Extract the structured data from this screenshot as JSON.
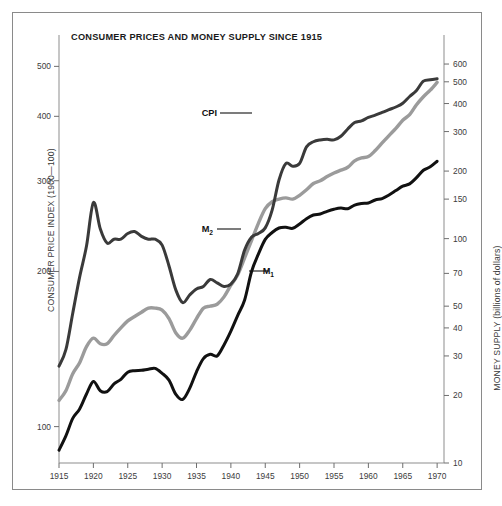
{
  "figure": {
    "title": "CONSUMER PRICES AND MONEY SUPPLY SINCE 1915",
    "border_color": "#8a8a8a",
    "background": "#ffffff"
  },
  "axes": {
    "left": {
      "title": "CONSUMER PRICE INDEX (1900—100)",
      "scale": "log",
      "ticks": [
        100,
        200,
        300,
        400,
        500
      ],
      "tick_labels": [
        "100",
        "200",
        "300",
        "400",
        "500"
      ],
      "range": [
        85,
        560
      ]
    },
    "right": {
      "title": "MONEY SUPPLY (billions of dollars)",
      "scale": "log",
      "ticks": [
        10,
        20,
        30,
        40,
        50,
        70,
        100,
        150,
        200,
        300,
        400,
        500,
        600
      ],
      "tick_labels": [
        "10",
        "20",
        "30",
        "40",
        "50",
        "70",
        "100",
        "150",
        "200",
        "300",
        "400",
        "500",
        "600"
      ],
      "range": [
        10,
        760
      ]
    },
    "bottom": {
      "ticks": [
        1915,
        1920,
        1925,
        1930,
        1935,
        1940,
        1945,
        1950,
        1955,
        1960,
        1965,
        1970
      ],
      "tick_labels": [
        "1915",
        "1920",
        "1925",
        "1930",
        "1935",
        "1940",
        "1945",
        "1950",
        "1955",
        "1960",
        "1965",
        "1970"
      ],
      "range": [
        1915,
        1971
      ]
    }
  },
  "annotations": {
    "cpi": {
      "text": "CPI",
      "leader": true
    },
    "m2": {
      "text": "M",
      "sub": "2",
      "leader": true
    },
    "m1": {
      "text": "M",
      "sub": "1",
      "leader": true
    }
  },
  "chart_data": {
    "type": "line",
    "title": "CONSUMER PRICES AND MONEY SUPPLY SINCE 1915",
    "xlabel": "",
    "ylabel": "CONSUMER PRICE INDEX (1900—100)",
    "y2label": "MONEY SUPPLY (billions of dollars)",
    "xscale": "linear",
    "yscale": "log",
    "y2scale": "log",
    "xlim": [
      1915,
      1971
    ],
    "ylim": [
      85,
      560
    ],
    "y2lim": [
      10,
      760
    ],
    "grid": false,
    "legend": "inline-annotations",
    "x": [
      1915,
      1916,
      1917,
      1918,
      1919,
      1920,
      1921,
      1922,
      1923,
      1924,
      1925,
      1926,
      1927,
      1928,
      1929,
      1930,
      1931,
      1932,
      1933,
      1934,
      1935,
      1936,
      1937,
      1938,
      1939,
      1940,
      1941,
      1942,
      1943,
      1944,
      1945,
      1946,
      1947,
      1948,
      1949,
      1950,
      1951,
      1952,
      1953,
      1954,
      1955,
      1956,
      1957,
      1958,
      1959,
      1960,
      1961,
      1962,
      1963,
      1964,
      1965,
      1966,
      1967,
      1968,
      1969,
      1970
    ],
    "series": [
      {
        "name": "CPI",
        "axis": "left",
        "color": "#3a3a3a",
        "width": 3.0,
        "values": [
          131,
          141,
          166,
          195,
          224,
          272,
          242,
          227,
          231,
          231,
          237,
          239,
          234,
          231,
          231,
          225,
          205,
          184,
          174,
          180,
          185,
          187,
          193,
          190,
          187,
          189,
          198,
          220,
          233,
          237,
          243,
          263,
          301,
          324,
          320,
          324,
          349,
          357,
          360,
          361,
          360,
          366,
          378,
          389,
          392,
          398,
          402,
          407,
          412,
          417,
          424,
          437,
          449,
          468,
          471,
          473
        ]
      },
      {
        "name": "M2",
        "axis": "right",
        "color": "#9b9b9b",
        "width": 3.4,
        "values": [
          19,
          21,
          25,
          28,
          33,
          36,
          34,
          34,
          37,
          40,
          43,
          45,
          47,
          49,
          49,
          48,
          44,
          38,
          36,
          39,
          44,
          49,
          50,
          51,
          55,
          62,
          69,
          82,
          98,
          117,
          136,
          146,
          150,
          152,
          150,
          156,
          165,
          176,
          181,
          189,
          196,
          202,
          208,
          222,
          229,
          232,
          247,
          267,
          288,
          310,
          337,
          357,
          395,
          429,
          459,
          497
        ]
      },
      {
        "name": "M1",
        "axis": "right",
        "color": "#111111",
        "width": 3.0,
        "values": [
          11.4,
          13.2,
          15.8,
          17.4,
          20.3,
          23.1,
          21.0,
          20.8,
          22.5,
          23.6,
          25.4,
          25.8,
          25.9,
          26.2,
          26.4,
          25.1,
          23.4,
          20.2,
          19.2,
          21.5,
          25.5,
          29.2,
          30.5,
          30.0,
          33.6,
          38.7,
          45.5,
          53.3,
          71.2,
          85.3,
          99.2,
          106.5,
          111.5,
          112.3,
          111.2,
          116.2,
          122.7,
          127.4,
          128.8,
          132.3,
          135.2,
          136.9,
          135.9,
          141.1,
          143.4,
          144.2,
          148.7,
          150.9,
          156.5,
          163.7,
          171.3,
          175.4,
          186.9,
          201.7,
          209.0,
          221.2
        ]
      }
    ]
  }
}
